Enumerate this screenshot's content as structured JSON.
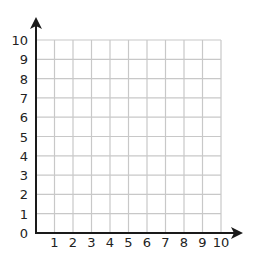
{
  "chart_data": {
    "type": "grid",
    "title": "",
    "xlabel": "",
    "ylabel": "",
    "xlim": [
      0,
      10
    ],
    "ylim": [
      0,
      10
    ],
    "grid": true,
    "x_ticks": [
      "1",
      "2",
      "3",
      "4",
      "5",
      "6",
      "7",
      "8",
      "9",
      "10"
    ],
    "y_ticks": [
      "0",
      "1",
      "2",
      "3",
      "4",
      "5",
      "6",
      "7",
      "8",
      "9",
      "10"
    ],
    "origin_label": "0",
    "arrows": {
      "x_axis": "right",
      "y_axis": "up"
    },
    "points": []
  },
  "colors": {
    "axis": "#1a1a1a",
    "grid": "#c8c8c8",
    "text": "#222222",
    "background": "#ffffff"
  }
}
